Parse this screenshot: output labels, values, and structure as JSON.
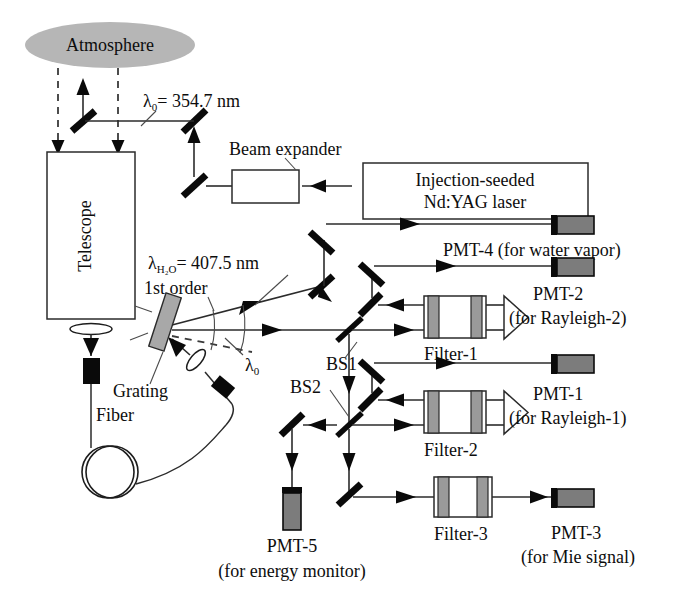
{
  "figure": {
    "type": "optical-schematic"
  },
  "colors": {
    "atmosphere_fill": "#b6b6b6",
    "pmt_body": "#7c7c7c",
    "filter_band": "#9a9a9a",
    "grating_fill": "#a8a8a8",
    "line": "#2b2b2b",
    "text": "#0d0d0d"
  },
  "labels": {
    "atmosphere": "Atmosphere",
    "telescope": "Telescope",
    "beam_expander": "Beam expander",
    "laser_line1": "Injection-seeded",
    "laser_line2": "Nd:YAG laser",
    "grating": "Grating",
    "fiber": "Fiber",
    "first_order": "1st order",
    "bs1": "BS1",
    "bs2": "BS2",
    "filter1": "Filter-1",
    "filter2": "Filter-2",
    "filter3": "Filter-3"
  },
  "wavelengths": {
    "lambda0_full": "λ0 = 354.7 nm",
    "lambda0_symbol": "λ",
    "lambda0_sub": "0",
    "lambda0_value": "= 354.7 nm",
    "lambda0_short_symbol": "λ",
    "lambda0_short_sub": "0",
    "lambda_h2o_symbol": "λ",
    "lambda_h2o_sub": "H2O",
    "lambda_h2o_sub_display": "H₂O",
    "lambda_h2o_value": "= 407.5 nm",
    "lambda_h2o_full": "λH2O = 407.5 nm"
  },
  "detectors": [
    {
      "id": "pmt-4",
      "name": "PMT-4",
      "purpose": "(for water vapor)",
      "combined": "PMT-4 (for water vapor)"
    },
    {
      "id": "pmt-2",
      "name": "PMT-2",
      "purpose": "(for Rayleigh-2)",
      "combined": "PMT-2 (for Rayleigh-2)"
    },
    {
      "id": "pmt-1",
      "name": "PMT-1",
      "purpose": "(for Rayleigh-1)",
      "combined": "PMT-1 (for Rayleigh-1)"
    },
    {
      "id": "pmt-3",
      "name": "PMT-3",
      "purpose": "(for Mie signal)",
      "combined": "PMT-3 (for Mie signal)"
    },
    {
      "id": "pmt-5",
      "name": "PMT-5",
      "purpose": "(for energy monitor)",
      "combined": "PMT-5 (for energy monitor)"
    }
  ],
  "filters": [
    {
      "id": "filter-1",
      "label": "Filter-1"
    },
    {
      "id": "filter-2",
      "label": "Filter-2"
    },
    {
      "id": "filter-3",
      "label": "Filter-3"
    }
  ],
  "beam_splitters": [
    {
      "id": "bs1",
      "label": "BS1"
    },
    {
      "id": "bs2",
      "label": "BS2"
    }
  ],
  "components": [
    {
      "id": "atmosphere",
      "label": "Atmosphere"
    },
    {
      "id": "telescope",
      "label": "Telescope"
    },
    {
      "id": "beam-expander",
      "label": "Beam expander"
    },
    {
      "id": "laser",
      "label": "Injection-seeded Nd:YAG laser"
    },
    {
      "id": "grating",
      "label": "Grating"
    },
    {
      "id": "fiber",
      "label": "Fiber"
    },
    {
      "id": "first-order",
      "label": "1st order"
    }
  ]
}
